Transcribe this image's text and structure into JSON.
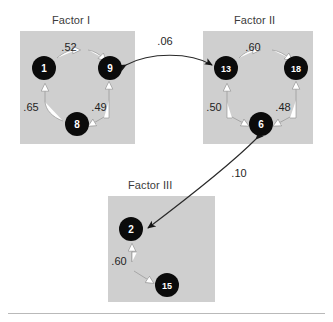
{
  "figure": {
    "type": "path-diagram",
    "background_color": "#ffffff",
    "panel_color": "#cfcfcf",
    "node_color": "#0b0b0b",
    "node_text_color": "#ffffff",
    "within_factor_arrow_color": "#ffffff",
    "between_factor_arrow_color": "#2a2a2a"
  },
  "panels": [
    {
      "id": "factor-1",
      "title": "Factor I",
      "title_x": 52,
      "title_y": 14,
      "rect": {
        "x": 20,
        "y": 31,
        "w": 115,
        "h": 113
      },
      "nodes": [
        {
          "id": "n1",
          "label": "1",
          "cx": 44,
          "cy": 68,
          "r": 12
        },
        {
          "id": "n9",
          "label": "9",
          "cx": 110,
          "cy": 68,
          "r": 12
        },
        {
          "id": "n8",
          "label": "8",
          "cx": 77,
          "cy": 124,
          "r": 12
        }
      ],
      "edges": [
        {
          "from": "n1",
          "to": "n9",
          "value": ".52",
          "label_x": 69,
          "label_y": 51
        },
        {
          "from": "n8",
          "to": "n1",
          "value": ".65",
          "label_x": 31,
          "label_y": 111
        },
        {
          "from": "n9",
          "to": "n8",
          "value": ".49",
          "label_x": 99,
          "label_y": 111
        }
      ]
    },
    {
      "id": "factor-2",
      "title": "Factor II",
      "title_x": 234,
      "title_y": 14,
      "rect": {
        "x": 203,
        "y": 31,
        "w": 110,
        "h": 113
      },
      "nodes": [
        {
          "id": "n13",
          "label": "13",
          "cx": 226,
          "cy": 68,
          "r": 12
        },
        {
          "id": "n18",
          "label": "18",
          "cx": 296,
          "cy": 68,
          "r": 12
        },
        {
          "id": "n6",
          "label": "6",
          "cx": 261,
          "cy": 124,
          "r": 12
        }
      ],
      "edges": [
        {
          "from": "n13",
          "to": "n18",
          "value": ".60",
          "label_x": 253,
          "label_y": 51
        },
        {
          "from": "n6",
          "to": "n13",
          "value": ".50",
          "label_x": 214,
          "label_y": 111
        },
        {
          "from": "n18",
          "to": "n6",
          "value": ".48",
          "label_x": 283,
          "label_y": 111
        }
      ]
    },
    {
      "id": "factor-3",
      "title": "Factor III",
      "title_x": 128,
      "title_y": 179,
      "rect": {
        "x": 108,
        "y": 196,
        "w": 107,
        "h": 106
      },
      "nodes": [
        {
          "id": "n2",
          "label": "2",
          "cx": 131,
          "cy": 229,
          "r": 12
        },
        {
          "id": "n15",
          "label": "15",
          "cx": 167,
          "cy": 285,
          "r": 12
        }
      ],
      "edges": [
        {
          "from": "n15",
          "to": "n2",
          "value": ".60",
          "label_x": 119,
          "label_y": 265
        }
      ]
    }
  ],
  "between_factor_links": [
    {
      "id": "link-f1-f2",
      "value": ".06",
      "from_panel": "factor-2",
      "to_panel": "factor-1",
      "bidirectional": true,
      "label_x": 165,
      "label_y": 45
    },
    {
      "id": "link-f3-f2",
      "value": ".10",
      "from_panel": "factor-2",
      "to_panel": "factor-3",
      "bidirectional": true,
      "label_x": 239,
      "label_y": 177
    }
  ],
  "bottom_rule": {
    "visible": true
  }
}
